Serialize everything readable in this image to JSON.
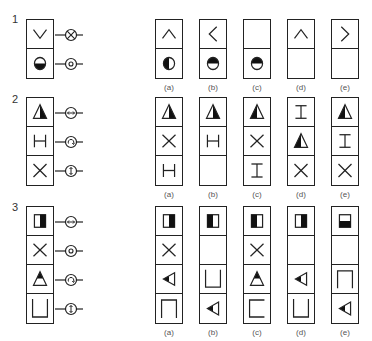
{
  "figure": {
    "caption_partial": "",
    "stroke_color": "#222222",
    "fill_color": "#111111"
  },
  "rows": [
    {
      "number": "1",
      "question": {
        "cells": [
          "chevron-down",
          "circle-bottom-filled"
        ],
        "symbols": [
          "cross-circle",
          "dot-circle"
        ]
      },
      "options": [
        {
          "label": "(a)",
          "cells": [
            "chevron-up",
            "circle-left-filled"
          ]
        },
        {
          "label": "(b)",
          "cells": [
            "chevron-left",
            "circle-top-filled"
          ]
        },
        {
          "label": "(c)",
          "cells": [
            "empty",
            "circle-top-filled"
          ]
        },
        {
          "label": "(d)",
          "cells": [
            "chevron-up",
            "empty"
          ]
        },
        {
          "label": "(e)",
          "cells": [
            "chevron-right",
            "empty"
          ]
        }
      ]
    },
    {
      "number": "2",
      "question": {
        "cells": [
          "triangle-right-filled",
          "h-bar",
          "x-cross"
        ],
        "symbols": [
          "horizontal-arrows-circle",
          "rotate-circle",
          "vertical-arrows-circle"
        ]
      },
      "options": [
        {
          "label": "(a)",
          "cells": [
            "triangle-right-filled",
            "x-cross",
            "h-bar"
          ]
        },
        {
          "label": "(b)",
          "cells": [
            "triangle-right-filled",
            "h-bar",
            "empty"
          ]
        },
        {
          "label": "(c)",
          "cells": [
            "triangle-left-filled",
            "x-cross",
            "i-beam"
          ]
        },
        {
          "label": "(d)",
          "cells": [
            "i-beam",
            "triangle-left-filled",
            "x-cross"
          ]
        },
        {
          "label": "(e)",
          "cells": [
            "triangle-left-filled",
            "i-beam",
            "x-cross"
          ]
        }
      ]
    },
    {
      "number": "3",
      "question": {
        "cells": [
          "square-right-filled",
          "x-cross",
          "triangle-top-filled",
          "cup"
        ],
        "symbols": [
          "horizontal-arrows-circle",
          "dot-circle",
          "rotate-circle",
          "vertical-arrows-circle"
        ]
      },
      "options": [
        {
          "label": "(a)",
          "cells": [
            "square-right-filled",
            "x-cross",
            "arrow-left-filled",
            "cap"
          ]
        },
        {
          "label": "(b)",
          "cells": [
            "square-left-filled",
            "empty",
            "cup",
            "arrow-left-filled"
          ]
        },
        {
          "label": "(c)",
          "cells": [
            "square-left-filled",
            "x-cross",
            "triangle-top-filled",
            "bracket-left"
          ]
        },
        {
          "label": "(d)",
          "cells": [
            "square-right-filled",
            "empty",
            "arrow-left-filled",
            "cup"
          ]
        },
        {
          "label": "(e)",
          "cells": [
            "square-bottom-filled",
            "empty",
            "cap",
            "arrow-left-filled"
          ]
        }
      ]
    }
  ]
}
